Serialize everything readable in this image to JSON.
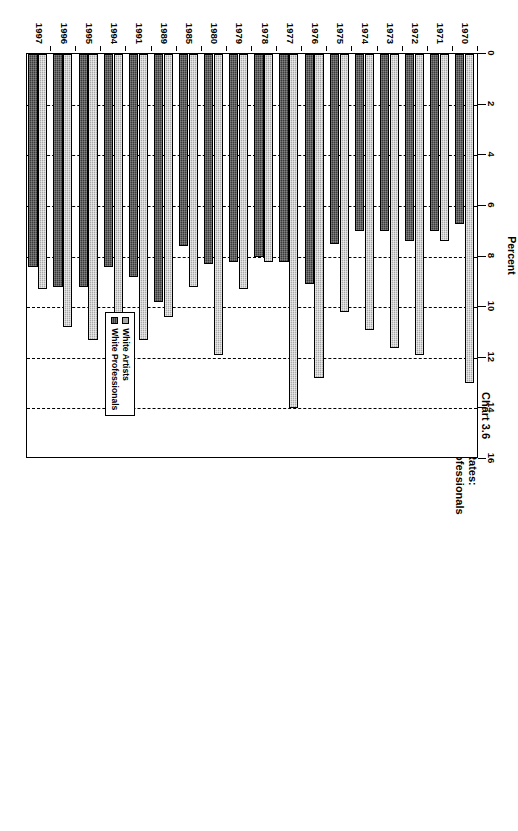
{
  "chart_data": {
    "type": "bar",
    "orientation": "horizontal",
    "title": "Chart 3.6",
    "subtitle": "Multiple Jobholding Rates:",
    "subtitle2": "White Artists and White Professionals",
    "xlabel": "Percent",
    "ylabel": "",
    "xlim": [
      0,
      16
    ],
    "xticks": [
      0,
      2,
      4,
      6,
      8,
      10,
      12,
      14,
      16
    ],
    "xtick_labels": [
      "0",
      "2",
      "4",
      "6",
      "8",
      "10",
      "12",
      "14",
      "16"
    ],
    "grid": true,
    "grid_axis": "x",
    "grid_style": "dashed",
    "legend_position": "bottom-right-inside",
    "categories": [
      "1970",
      "1971",
      "1972",
      "1973",
      "1974",
      "1975",
      "1976",
      "1977",
      "1978",
      "1979",
      "1980",
      "1985",
      "1989",
      "1991",
      "1994",
      "1995",
      "1996",
      "1997"
    ],
    "series": [
      {
        "name": "White Artists",
        "color": "#a8a8a8",
        "values": [
          13.0,
          7.4,
          11.9,
          11.6,
          10.9,
          10.2,
          12.8,
          14.0,
          8.2,
          9.3,
          11.9,
          9.2,
          10.4,
          11.3,
          10.4,
          11.3,
          10.8,
          9.3
        ]
      },
      {
        "name": "White Professionals",
        "color": "#3a3a3a",
        "values": [
          6.7,
          7.0,
          7.4,
          7.0,
          7.0,
          7.5,
          9.1,
          8.2,
          8.0,
          8.2,
          8.3,
          7.6,
          9.8,
          8.8,
          8.4,
          9.2,
          9.2,
          8.4
        ]
      }
    ]
  },
  "legend": {
    "items": [
      {
        "label": "White Artists",
        "swatch": "artists"
      },
      {
        "label": "White Professionals",
        "swatch": "professionals"
      }
    ]
  }
}
